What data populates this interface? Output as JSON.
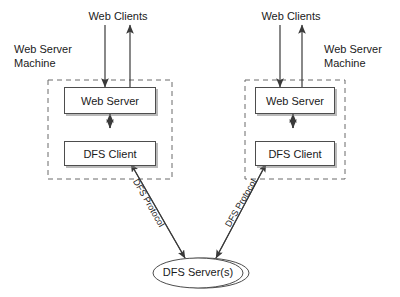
{
  "diagram": {
    "background_color": "#ffffff",
    "stroke_color": "#4d4d4d",
    "text_color": "#1a1a1a",
    "left_cluster": {
      "machine_label_line1": "Web Server",
      "machine_label_line2": "Machine",
      "clients_label": "Web Clients",
      "web_server_label": "Web Server",
      "dfs_client_label": "DFS Client",
      "protocol_label": "DFS Protocol"
    },
    "right_cluster": {
      "machine_label_line1": "Web Server",
      "machine_label_line2": "Machine",
      "clients_label": "Web Clients",
      "web_server_label": "Web Server",
      "dfs_client_label": "DFS Client",
      "protocol_label": "DFS Protocol"
    },
    "server": {
      "label": "DFS Server(s)"
    }
  }
}
